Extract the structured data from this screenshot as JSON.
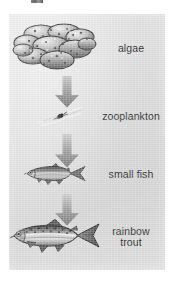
{
  "diagram": {
    "type": "food-chain",
    "orientation": "vertical",
    "background_color": "#dcdcdc",
    "text_color": "#2b2b2b",
    "arrow_color": "#8a8a8a",
    "top_artifact": "cropped-label-remnant",
    "stages": [
      {
        "id": "algae",
        "label": "algae",
        "order": 1,
        "organism": "algae-cluster-illustration",
        "trophic_role": "producer"
      },
      {
        "id": "zooplankton",
        "label": "zooplankton",
        "order": 2,
        "organism": "zooplankton-illustration",
        "trophic_role": "primary-consumer"
      },
      {
        "id": "small-fish",
        "label": "small fish",
        "order": 3,
        "organism": "small-fish-illustration",
        "trophic_role": "secondary-consumer"
      },
      {
        "id": "rainbow-trout",
        "label": "rainbow\ntrout",
        "order": 4,
        "organism": "rainbow-trout-illustration",
        "trophic_role": "tertiary-consumer"
      }
    ],
    "arrows": [
      {
        "id": "arrow-algae-to-zooplankton",
        "from": "algae",
        "to": "zooplankton",
        "direction": "down"
      },
      {
        "id": "arrow-zooplankton-to-small-fish",
        "from": "zooplankton",
        "to": "small-fish",
        "direction": "down"
      },
      {
        "id": "arrow-small-fish-to-rainbow-trout",
        "from": "small-fish",
        "to": "rainbow-trout",
        "direction": "down"
      }
    ]
  }
}
